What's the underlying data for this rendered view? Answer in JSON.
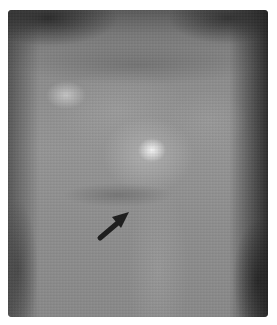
{
  "image": {
    "type": "grayscale radiograph",
    "annotation": {
      "kind": "arrow",
      "direction": "up-right",
      "color": "#1e1e1e"
    },
    "colors": {
      "background": "#ffffff",
      "tissue_mid": "#8e8e8e",
      "highlight": "#f0f0f0",
      "dark_edge": "#2a2a2a"
    }
  }
}
